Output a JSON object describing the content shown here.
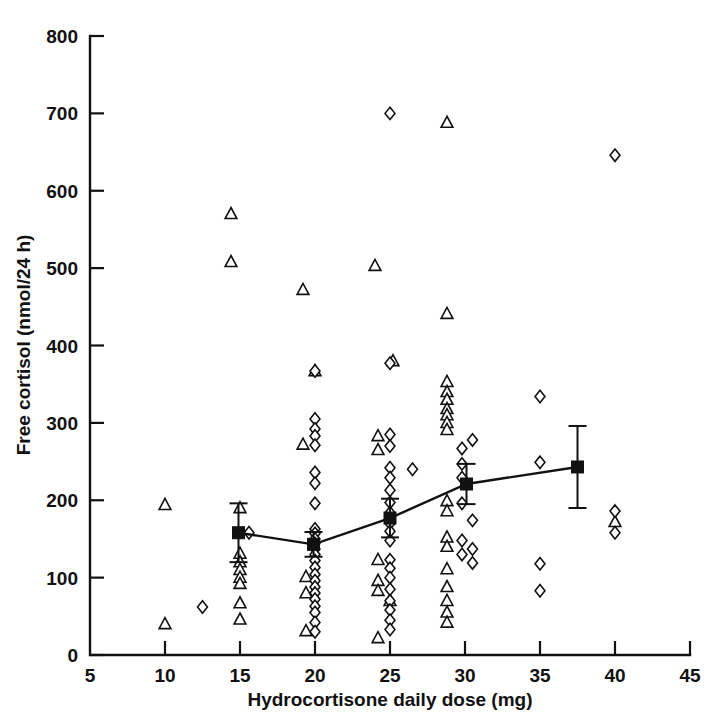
{
  "chart_data": {
    "type": "scatter",
    "title": "",
    "xlabel": "Hydrocortisone daily dose (mg)",
    "ylabel": "Free cortisol (nmol/24 h)",
    "xlim": [
      5,
      45
    ],
    "ylim": [
      0,
      800
    ],
    "xticks": [
      5,
      10,
      15,
      20,
      25,
      30,
      35,
      40,
      45
    ],
    "yticks": [
      0,
      100,
      200,
      300,
      400,
      500,
      600,
      700,
      800
    ],
    "xtick_labels": [
      "5",
      "10",
      "15",
      "20",
      "25",
      "30",
      "35",
      "40",
      "45"
    ],
    "ytick_labels": [
      "0",
      "100",
      "200",
      "300",
      "400",
      "500",
      "600",
      "700",
      "800"
    ],
    "grid": false,
    "legend_position": "none",
    "series": [
      {
        "name": "triangle-group",
        "marker": "open-triangle",
        "points": [
          [
            10.0,
            194
          ],
          [
            10.0,
            40
          ],
          [
            14.4,
            570
          ],
          [
            14.4,
            508
          ],
          [
            15.0,
            190
          ],
          [
            15.0,
            131
          ],
          [
            15.0,
            120
          ],
          [
            15.0,
            110
          ],
          [
            15.0,
            100
          ],
          [
            15.0,
            92
          ],
          [
            15.0,
            67
          ],
          [
            15.0,
            46
          ],
          [
            19.2,
            472
          ],
          [
            19.2,
            272
          ],
          [
            19.4,
            101
          ],
          [
            19.4,
            80
          ],
          [
            19.4,
            31
          ],
          [
            20.0,
            367
          ],
          [
            24.0,
            503
          ],
          [
            24.2,
            283
          ],
          [
            24.2,
            265
          ],
          [
            24.2,
            123
          ],
          [
            24.2,
            96
          ],
          [
            24.2,
            83
          ],
          [
            24.2,
            22
          ],
          [
            25.2,
            380
          ],
          [
            25.0,
            70
          ],
          [
            28.8,
            688
          ],
          [
            28.8,
            441
          ],
          [
            28.8,
            353
          ],
          [
            28.8,
            340
          ],
          [
            28.8,
            330
          ],
          [
            28.8,
            318
          ],
          [
            28.8,
            310
          ],
          [
            28.8,
            300
          ],
          [
            28.8,
            291
          ],
          [
            28.8,
            199
          ],
          [
            28.8,
            186
          ],
          [
            28.8,
            152
          ],
          [
            28.8,
            140
          ],
          [
            28.8,
            111
          ],
          [
            28.8,
            88
          ],
          [
            28.8,
            70
          ],
          [
            28.8,
            55
          ],
          [
            28.8,
            42
          ],
          [
            40.0,
            172
          ]
        ]
      },
      {
        "name": "diamond-group",
        "marker": "open-diamond",
        "points": [
          [
            12.5,
            62
          ],
          [
            15.6,
            158
          ],
          [
            20.0,
            367
          ],
          [
            20.0,
            305
          ],
          [
            20.0,
            292
          ],
          [
            20.0,
            283
          ],
          [
            20.0,
            271
          ],
          [
            20.0,
            236
          ],
          [
            20.0,
            222
          ],
          [
            20.0,
            196
          ],
          [
            20.0,
            163
          ],
          [
            20.0,
            157
          ],
          [
            20.0,
            150
          ],
          [
            20.0,
            144
          ],
          [
            20.0,
            137
          ],
          [
            20.0,
            130
          ],
          [
            20.0,
            122
          ],
          [
            20.0,
            113
          ],
          [
            20.0,
            104
          ],
          [
            20.0,
            96
          ],
          [
            20.0,
            88
          ],
          [
            20.0,
            80
          ],
          [
            20.0,
            72
          ],
          [
            20.0,
            63
          ],
          [
            20.0,
            55
          ],
          [
            20.0,
            42
          ],
          [
            20.0,
            30
          ],
          [
            25.0,
            700
          ],
          [
            25.0,
            377
          ],
          [
            25.0,
            285
          ],
          [
            25.0,
            270
          ],
          [
            25.0,
            242
          ],
          [
            25.0,
            229
          ],
          [
            25.0,
            213
          ],
          [
            25.0,
            197
          ],
          [
            25.0,
            184
          ],
          [
            25.0,
            170
          ],
          [
            25.0,
            160
          ],
          [
            25.0,
            148
          ],
          [
            25.0,
            123
          ],
          [
            25.0,
            112
          ],
          [
            25.0,
            100
          ],
          [
            25.0,
            85
          ],
          [
            25.0,
            70
          ],
          [
            25.0,
            58
          ],
          [
            25.0,
            45
          ],
          [
            25.0,
            33
          ],
          [
            26.5,
            240
          ],
          [
            29.8,
            267
          ],
          [
            29.8,
            247
          ],
          [
            29.8,
            229
          ],
          [
            29.8,
            196
          ],
          [
            29.8,
            148
          ],
          [
            29.8,
            130
          ],
          [
            30.5,
            278
          ],
          [
            30.5,
            174
          ],
          [
            30.5,
            137
          ],
          [
            30.5,
            119
          ],
          [
            35.0,
            334
          ],
          [
            35.0,
            249
          ],
          [
            35.0,
            118
          ],
          [
            35.0,
            83
          ],
          [
            40.0,
            646
          ],
          [
            40.0,
            186
          ],
          [
            40.0,
            158
          ]
        ]
      },
      {
        "name": "mean-with-sem",
        "marker": "filled-square",
        "label": "mean ± SEM",
        "points": [
          {
            "x": 14.9,
            "y": 158,
            "err_low": 38,
            "err_high": 38
          },
          {
            "x": 19.9,
            "y": 143,
            "err_low": 16,
            "err_high": 16
          },
          {
            "x": 25.0,
            "y": 177,
            "err_low": 25,
            "err_high": 25
          },
          {
            "x": 30.1,
            "y": 221,
            "err_low": 26,
            "err_high": 26
          },
          {
            "x": 37.5,
            "y": 243,
            "err_low": 53,
            "err_high": 53
          }
        ]
      }
    ]
  }
}
